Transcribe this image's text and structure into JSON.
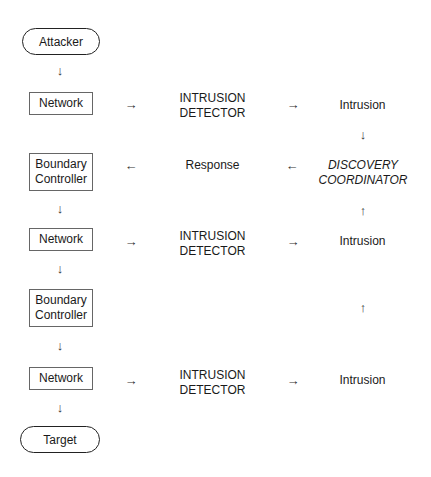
{
  "diagram": {
    "left_column": {
      "start": "Attacker",
      "network_1": "Network",
      "boundary_1": [
        "Boundary",
        "Controller"
      ],
      "network_2": "Network",
      "boundary_2": [
        "Boundary",
        "Controller"
      ],
      "network_3": "Network",
      "end": "Target"
    },
    "middle_column": {
      "detector_1": [
        "INTRUSION",
        "DETECTOR"
      ],
      "response": "Response",
      "detector_2": [
        "INTRUSION",
        "DETECTOR"
      ],
      "detector_3": [
        "INTRUSION",
        "DETECTOR"
      ]
    },
    "right_column": {
      "intrusion_1": "Intrusion",
      "coordinator": [
        "DISCOVERY",
        "COORDINATOR"
      ],
      "intrusion_2": "Intrusion",
      "intrusion_3": "Intrusion"
    },
    "arrows": {
      "down": "↓",
      "up": "↑",
      "right": "→",
      "left": "←"
    }
  }
}
